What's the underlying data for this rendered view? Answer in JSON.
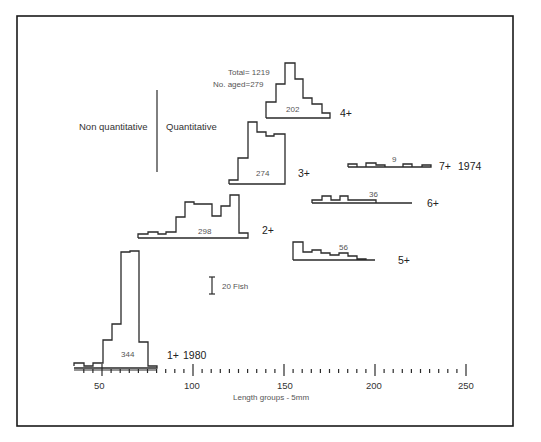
{
  "chart_data": {
    "type": "bar",
    "subtype": "stepped histograms (length-frequency by age group)",
    "title": "",
    "summary": {
      "total_label": "Total=",
      "total": "1219",
      "aged_label": "No. aged=",
      "aged": "279"
    },
    "xlabel": "Length groups - 5mm",
    "ylabel": "",
    "x_ticks": [
      50,
      100,
      150,
      200,
      250
    ],
    "xlim": [
      35,
      255
    ],
    "minor_tick_step": 5,
    "scale_bar": "20 Fish",
    "divider_labels": {
      "left": "Non quantitative",
      "right": "Quantitative"
    },
    "legend_years": {
      "youngest": "1980",
      "oldest": "1974"
    },
    "series": [
      {
        "name": "1+",
        "year": "1980",
        "n": "344",
        "points": [
          [
            74,
            366
          ],
          [
            74,
            363
          ],
          [
            84,
            363
          ],
          [
            84,
            366
          ],
          [
            93,
            366
          ],
          [
            93,
            363
          ],
          [
            103,
            363
          ],
          [
            103,
            362
          ],
          [
            103,
            340
          ],
          [
            112,
            340
          ],
          [
            112,
            324
          ],
          [
            121,
            324
          ],
          [
            121,
            252
          ],
          [
            130,
            252
          ],
          [
            130,
            251
          ],
          [
            139,
            251
          ],
          [
            139,
            342
          ],
          [
            148,
            342
          ],
          [
            148,
            366
          ],
          [
            157,
            366
          ],
          [
            157,
            368
          ],
          [
            74,
            368
          ]
        ]
      },
      {
        "name": "2+",
        "year": "",
        "n": "298",
        "points": [
          [
            138,
            238
          ],
          [
            138,
            234
          ],
          [
            148,
            234
          ],
          [
            148,
            232
          ],
          [
            158,
            232
          ],
          [
            158,
            234
          ],
          [
            166,
            234
          ],
          [
            166,
            232
          ],
          [
            176,
            232
          ],
          [
            176,
            217
          ],
          [
            185,
            217
          ],
          [
            185,
            202
          ],
          [
            194,
            202
          ],
          [
            194,
            204
          ],
          [
            212,
            204
          ],
          [
            212,
            216
          ],
          [
            221,
            216
          ],
          [
            221,
            206
          ],
          [
            230,
            206
          ],
          [
            230,
            195
          ],
          [
            239,
            195
          ],
          [
            239,
            233
          ],
          [
            248,
            233
          ],
          [
            248,
            238
          ],
          [
            138,
            238
          ]
        ]
      },
      {
        "name": "3+",
        "year": "",
        "n": "274",
        "points": [
          [
            229,
            184
          ],
          [
            229,
            180
          ],
          [
            238,
            180
          ],
          [
            238,
            158
          ],
          [
            248,
            158
          ],
          [
            248,
            122
          ],
          [
            257,
            122
          ],
          [
            257,
            132
          ],
          [
            266,
            132
          ],
          [
            266,
            136
          ],
          [
            274,
            136
          ],
          [
            274,
            134
          ],
          [
            285,
            134
          ],
          [
            285,
            184
          ],
          [
            229,
            184
          ]
        ]
      },
      {
        "name": "4+",
        "year": "",
        "n": "202",
        "points": [
          [
            266,
            118
          ],
          [
            266,
            102
          ],
          [
            276,
            102
          ],
          [
            276,
            84
          ],
          [
            285,
            84
          ],
          [
            285,
            63
          ],
          [
            295,
            63
          ],
          [
            295,
            79
          ],
          [
            303,
            79
          ],
          [
            303,
            98
          ],
          [
            312,
            98
          ],
          [
            312,
            104
          ],
          [
            322,
            104
          ],
          [
            322,
            113
          ],
          [
            330,
            113
          ],
          [
            330,
            118
          ],
          [
            266,
            118
          ]
        ]
      },
      {
        "name": "5+",
        "year": "",
        "n": "56",
        "points": [
          [
            293,
            260
          ],
          [
            293,
            242
          ],
          [
            303,
            242
          ],
          [
            303,
            252
          ],
          [
            312,
            252
          ],
          [
            312,
            250
          ],
          [
            321,
            250
          ],
          [
            321,
            253
          ],
          [
            330,
            253
          ],
          [
            330,
            255
          ],
          [
            339,
            255
          ],
          [
            339,
            253
          ],
          [
            348,
            253
          ],
          [
            348,
            256
          ],
          [
            357,
            256
          ],
          [
            357,
            259
          ],
          [
            366,
            259
          ],
          [
            366,
            260
          ],
          [
            375,
            260
          ],
          [
            293,
            260
          ]
        ]
      },
      {
        "name": "6+",
        "year": "",
        "n": "36",
        "points": [
          [
            312,
            203
          ],
          [
            312,
            200
          ],
          [
            322,
            200
          ],
          [
            322,
            196
          ],
          [
            331,
            196
          ],
          [
            331,
            200
          ],
          [
            340,
            200
          ],
          [
            340,
            196
          ],
          [
            348,
            196
          ],
          [
            348,
            200
          ],
          [
            376,
            200
          ],
          [
            376,
            203
          ],
          [
            412,
            203
          ],
          [
            312,
            203
          ]
        ]
      },
      {
        "name": "7+",
        "year": "1974",
        "n": "9",
        "points": [
          [
            348,
            167
          ],
          [
            348,
            164
          ],
          [
            357,
            164
          ],
          [
            357,
            167
          ],
          [
            366,
            167
          ],
          [
            366,
            163
          ],
          [
            376,
            163
          ],
          [
            376,
            165
          ],
          [
            385,
            165
          ],
          [
            385,
            167
          ],
          [
            403,
            167
          ],
          [
            403,
            164
          ],
          [
            412,
            164
          ],
          [
            412,
            167
          ],
          [
            422,
            167
          ],
          [
            422,
            165
          ],
          [
            431,
            165
          ],
          [
            431,
            167
          ],
          [
            348,
            167
          ]
        ]
      }
    ]
  },
  "labels": {
    "age_1": "1+",
    "age_2": "2+",
    "age_3": "3+",
    "age_4": "4+",
    "age_5": "5+",
    "age_6": "6+",
    "age_7": "7+",
    "n_1": "344",
    "n_2": "298",
    "n_3": "274",
    "n_4": "202",
    "n_5": "56",
    "n_6": "36",
    "n_7": "9",
    "year_1": "1980",
    "year_7": "1974",
    "total": "Total= 1219",
    "aged": "No. aged=279",
    "non_quant": "Non quantitative",
    "quant": "Quantitative",
    "scale": "20 Fish",
    "xlabel": "Length groups - 5mm",
    "tick_50": "50",
    "tick_100": "100",
    "tick_150": "150",
    "tick_200": "200",
    "tick_250": "250"
  },
  "colors": {
    "ink": "#2a2a2a",
    "frame": "#1a1a1a",
    "background": "#ffffff"
  }
}
